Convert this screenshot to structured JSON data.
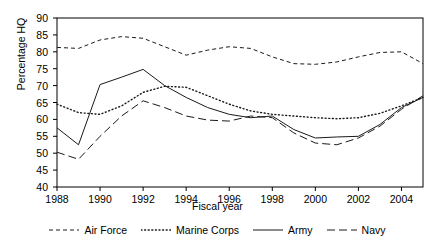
{
  "chart_data": {
    "type": "line",
    "title": "",
    "xlabel": "Fiscal year",
    "ylabel": "Percentage HQ",
    "xlim": [
      1988,
      2005
    ],
    "ylim": [
      40,
      90
    ],
    "grid": false,
    "legend_position": "bottom",
    "xticks": [
      "1988",
      "1990",
      "1992",
      "1994",
      "1996",
      "1998",
      "2000",
      "2002",
      "2004"
    ],
    "xtick_values": [
      1988,
      1990,
      1992,
      1994,
      1996,
      1998,
      2000,
      2002,
      2004
    ],
    "yticks": [
      "40",
      "45",
      "50",
      "55",
      "60",
      "65",
      "70",
      "75",
      "80",
      "85",
      "90"
    ],
    "ytick_values": [
      40,
      45,
      50,
      55,
      60,
      65,
      70,
      75,
      80,
      85,
      90
    ],
    "x": [
      1988,
      1989,
      1990,
      1991,
      1992,
      1993,
      1994,
      1995,
      1996,
      1997,
      1998,
      1999,
      2000,
      2001,
      2002,
      2003,
      2004,
      2005
    ],
    "series": [
      {
        "name": "Air Force",
        "dash": "4,3",
        "values": [
          81.3,
          81.0,
          83.5,
          84.5,
          84.0,
          81.5,
          79.0,
          80.5,
          81.5,
          81.0,
          78.5,
          76.5,
          76.3,
          77.0,
          78.5,
          79.8,
          80.0,
          76.5
        ]
      },
      {
        "name": "Marine Corps",
        "dash": "1,2.6",
        "values": [
          64.5,
          62.0,
          61.5,
          64.0,
          68.0,
          69.8,
          69.5,
          67.0,
          64.5,
          62.5,
          61.5,
          61.0,
          60.5,
          60.2,
          60.5,
          61.8,
          64.0,
          66.5
        ]
      },
      {
        "name": "Army",
        "dash": "none",
        "values": [
          57.5,
          52.5,
          70.3,
          72.5,
          74.8,
          70.0,
          66.5,
          63.5,
          61.5,
          60.5,
          61.0,
          57.0,
          54.5,
          54.8,
          55.0,
          58.5,
          63.5,
          66.5
        ]
      },
      {
        "name": "Navy",
        "dash": "8,4",
        "values": [
          50.3,
          48.2,
          55.0,
          61.0,
          65.5,
          63.5,
          61.0,
          59.8,
          59.5,
          61.0,
          60.5,
          56.0,
          53.0,
          52.5,
          54.5,
          58.0,
          63.0,
          67.0
        ]
      }
    ]
  },
  "legend": {
    "items": [
      {
        "label": "Air Force"
      },
      {
        "label": "Marine Corps"
      },
      {
        "label": "Army"
      },
      {
        "label": "Navy"
      }
    ]
  }
}
